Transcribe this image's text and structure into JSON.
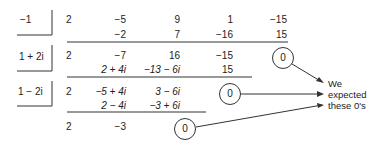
{
  "divisors": [
    "−1",
    "1 + 2i",
    "1 − 2i"
  ],
  "rows": [
    {
      "name": "coefficients",
      "cells": [
        "2",
        "−5",
        "9",
        "1",
        "−15"
      ]
    },
    {
      "name": "product-1",
      "cells": [
        "",
        "−2",
        "7",
        "−16",
        "15"
      ]
    },
    {
      "name": "quotient-1",
      "cells": [
        "2",
        "−7",
        "16",
        "−15",
        "0"
      ]
    },
    {
      "name": "product-2",
      "cells": [
        "",
        "2 + 4i",
        "−13 − 6i",
        "15",
        ""
      ]
    },
    {
      "name": "quotient-2",
      "cells": [
        "2",
        "−5 + 4i",
        "3 − 6i",
        "0",
        ""
      ]
    },
    {
      "name": "product-3",
      "cells": [
        "",
        "2 − 4i",
        "−3 + 6i",
        "",
        ""
      ]
    },
    {
      "name": "quotient-3",
      "cells": [
        "2",
        "−3",
        "0",
        "",
        ""
      ]
    }
  ],
  "zeros": [
    "0",
    "0",
    "0"
  ],
  "note": {
    "line1": "We",
    "line2": "expected",
    "line3": "these 0's"
  }
}
